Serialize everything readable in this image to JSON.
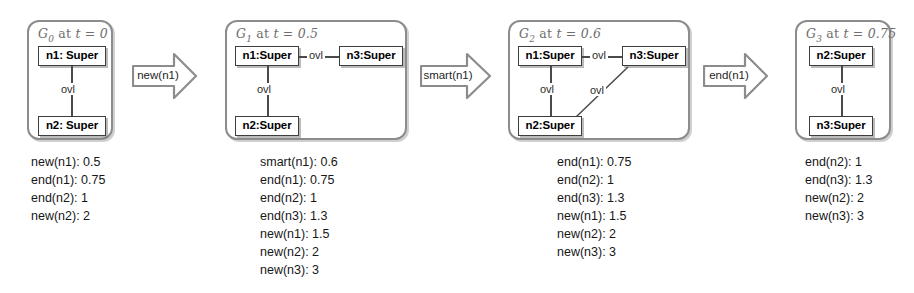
{
  "figure": {
    "kind": "graph-transformation-sequence",
    "colors": {
      "box_border": "#8c8c8c",
      "node_border": "#3d3d3d",
      "edge": "#4a4a4a",
      "title_text": "#6e6e6e",
      "body_text": "#171717",
      "background": "#ffffff"
    }
  },
  "graphs": [
    {
      "id": "G0",
      "name": "G",
      "subscript": "0",
      "at_label": "at",
      "time_label": "t = 0",
      "title_full": "G0 at t = 0",
      "nodes": [
        {
          "key": "n1",
          "label": "n1: Super"
        },
        {
          "key": "n2",
          "label": "n2: Super"
        }
      ],
      "edges": [
        {
          "from": "n1",
          "to": "n2",
          "label": "ovl"
        }
      ]
    },
    {
      "id": "G1",
      "name": "G",
      "subscript": "1",
      "at_label": "at",
      "time_label": "t = 0.5",
      "title_full": "G1 at t = 0.5",
      "nodes": [
        {
          "key": "n1",
          "label": "n1:Super"
        },
        {
          "key": "n3",
          "label": "n3:Super"
        },
        {
          "key": "n2",
          "label": "n2:Super"
        }
      ],
      "edges": [
        {
          "from": "n1",
          "to": "n3",
          "label": "ovl"
        },
        {
          "from": "n1",
          "to": "n2",
          "label": "ovl"
        }
      ]
    },
    {
      "id": "G2",
      "name": "G",
      "subscript": "2",
      "at_label": "at",
      "time_label": "t = 0.6",
      "title_full": "G2 at t = 0.6",
      "nodes": [
        {
          "key": "n1",
          "label": "n1:Super"
        },
        {
          "key": "n3",
          "label": "n3:Super"
        },
        {
          "key": "n2",
          "label": "n2:Super"
        }
      ],
      "edges": [
        {
          "from": "n1",
          "to": "n3",
          "label": "ovl"
        },
        {
          "from": "n1",
          "to": "n2",
          "label": "ovl"
        },
        {
          "from": "n2",
          "to": "n3",
          "label": "ovl"
        }
      ]
    },
    {
      "id": "G3",
      "name": "G",
      "subscript": "3",
      "at_label": "at",
      "time_label": "t = 0.75",
      "title_full": "G3 at t = 0.75",
      "nodes": [
        {
          "key": "n2",
          "label": "n2:Super"
        },
        {
          "key": "n3",
          "label": "n3:Super"
        }
      ],
      "edges": [
        {
          "from": "n2",
          "to": "n3",
          "label": "ovl"
        }
      ]
    }
  ],
  "transitions": [
    {
      "label": "new(n1)"
    },
    {
      "label": "smart(n1)"
    },
    {
      "label": "end(n1)"
    }
  ],
  "event_lists": [
    {
      "for_graph": "G0",
      "rows": [
        "new(n1): 0.5",
        "end(n1): 0.75",
        "end(n2): 1",
        "new(n2): 2"
      ]
    },
    {
      "for_graph": "G1",
      "rows": [
        "smart(n1): 0.6",
        "end(n1): 0.75",
        "end(n2): 1",
        "end(n3): 1.3",
        "new(n1): 1.5",
        "new(n2): 2",
        "new(n3): 3"
      ]
    },
    {
      "for_graph": "G2",
      "rows": [
        "end(n1): 0.75",
        "end(n2): 1",
        "end(n3): 1.3",
        "new(n1): 1.5",
        "new(n2): 2",
        "new(n3): 3"
      ]
    },
    {
      "for_graph": "G3",
      "rows": [
        "end(n2): 1",
        "end(n3): 1.3",
        "new(n2): 2",
        "new(n3): 3"
      ]
    }
  ]
}
